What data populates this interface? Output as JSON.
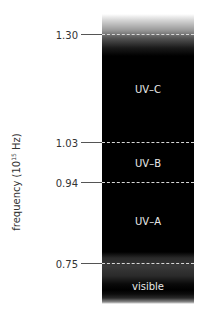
{
  "diagram": {
    "axis_label": {
      "text": "frequency (10",
      "exponent": "15",
      "unit": " Hz)"
    },
    "ticks": [
      {
        "label": "1.30",
        "y": 34
      },
      {
        "label": "1.03",
        "y": 142
      },
      {
        "label": "0.94",
        "y": 182
      },
      {
        "label": "0.75",
        "y": 263
      }
    ],
    "regions": [
      {
        "label": "UV–C",
        "y": 89
      },
      {
        "label": "UV–B",
        "y": 163
      },
      {
        "label": "UV–A",
        "y": 221
      },
      {
        "label": "visible",
        "y": 286
      }
    ],
    "colors": {
      "bar": "#000000",
      "dash": "#d8d8d8",
      "tick": "#555555"
    }
  }
}
